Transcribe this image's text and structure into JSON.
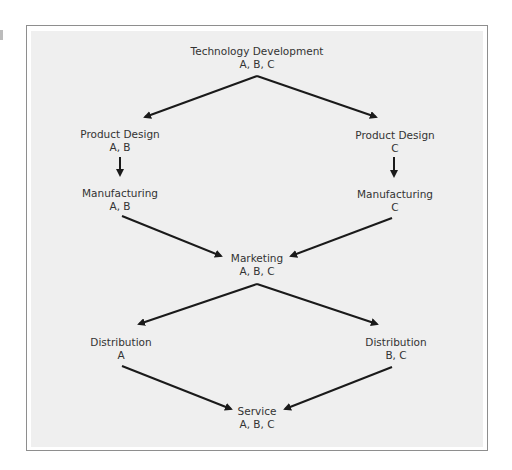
{
  "diagram": {
    "type": "flow",
    "colors": {
      "frame_border": "#8e8e8e",
      "background": "#efefef",
      "arrow": "#1a1a1a",
      "text": "#333333"
    },
    "nodes": [
      {
        "id": "tech_dev",
        "title": "Technology Development",
        "sub": "A, B, C"
      },
      {
        "id": "pd_ab",
        "title": "Product Design",
        "sub": "A, B"
      },
      {
        "id": "pd_c",
        "title": "Product Design",
        "sub": "C"
      },
      {
        "id": "mfg_ab",
        "title": "Manufacturing",
        "sub": "A, B"
      },
      {
        "id": "mfg_c",
        "title": "Manufacturing",
        "sub": "C"
      },
      {
        "id": "marketing",
        "title": "Marketing",
        "sub": "A, B, C"
      },
      {
        "id": "dist_a",
        "title": "Distribution",
        "sub": "A"
      },
      {
        "id": "dist_bc",
        "title": "Distribution",
        "sub": "B, C"
      },
      {
        "id": "service",
        "title": "Service",
        "sub": "A, B, C"
      }
    ],
    "edges": [
      {
        "from": "tech_dev",
        "to": "pd_ab"
      },
      {
        "from": "tech_dev",
        "to": "pd_c"
      },
      {
        "from": "pd_ab",
        "to": "mfg_ab"
      },
      {
        "from": "pd_c",
        "to": "mfg_c"
      },
      {
        "from": "mfg_ab",
        "to": "marketing"
      },
      {
        "from": "mfg_c",
        "to": "marketing"
      },
      {
        "from": "marketing",
        "to": "dist_a"
      },
      {
        "from": "marketing",
        "to": "dist_bc"
      },
      {
        "from": "dist_a",
        "to": "service"
      },
      {
        "from": "dist_bc",
        "to": "service"
      }
    ]
  }
}
